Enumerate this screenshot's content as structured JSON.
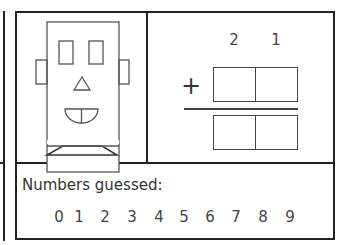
{
  "game": {
    "robot": {
      "parts": [
        "head",
        "left-ear",
        "right-ear",
        "left-eye",
        "right-eye",
        "nose",
        "mouth",
        "base"
      ]
    },
    "problem": {
      "top_number_digits": [
        "2",
        "1"
      ],
      "operator": "+",
      "addend_boxes": [
        "",
        ""
      ],
      "sum_boxes": [
        "",
        ""
      ]
    },
    "guessed": {
      "label": "Numbers guessed:",
      "digits": [
        "0",
        "1",
        "2",
        "3",
        "4",
        "5",
        "6",
        "7",
        "8",
        "9"
      ]
    }
  }
}
